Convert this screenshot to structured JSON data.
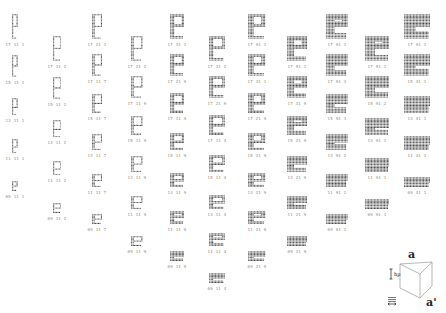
{
  "glyph_char": "e",
  "dot_color": "#3a3a3a",
  "label_color": "#888888",
  "columns": [
    {
      "x": 15,
      "y0": 14,
      "step": 38,
      "w": 6,
      "weights": 1,
      "labels": [
        "17 11 1",
        "15 11 1",
        "13 11 1",
        "11 11 1",
        "09 11 1"
      ]
    },
    {
      "x": 57,
      "y0": 36,
      "step": 38,
      "w": 8,
      "weights": 1,
      "labels": [
        "17 11 2",
        "15 11 2",
        "13 11 2",
        "11 11 2",
        "09 11 2"
      ]
    },
    {
      "x": 97,
      "y0": 14,
      "step": 37,
      "w": 10,
      "weights": 2,
      "labels": [
        "17 21 1",
        "17 11 7",
        "15 11 7",
        "13 11 7",
        "11 11 7",
        "09 11 7"
      ]
    },
    {
      "x": 137,
      "y0": 36,
      "step": 37,
      "w": 12,
      "weights": 2,
      "labels": [
        "17 21 2",
        "17 11 9",
        "15 11 9",
        "13 11 9",
        "11 11 9",
        "09 11 9"
      ]
    },
    {
      "x": 177,
      "y0": 14,
      "step": 37,
      "w": 14,
      "weights": 3,
      "labels": [
        "17 31 1",
        "17 21 9",
        "17 11 9",
        "15 11 9",
        "13 11 9",
        "11 11 9",
        "09 11 9"
      ]
    },
    {
      "x": 217,
      "y0": 36,
      "step": 37,
      "w": 16,
      "weights": 3,
      "labels": [
        "17 31 2",
        "17 21 9",
        "17 11 4",
        "15 11 4",
        "13 11 4",
        "11 11 4",
        "09 11 4"
      ]
    },
    {
      "x": 257,
      "y0": 14,
      "step": 37,
      "w": 18,
      "weights": 4,
      "labels": [
        "17 91 1",
        "17 31 1",
        "17 21 9",
        "15 21 9",
        "13 21 9",
        "11 21 9",
        "09 21 9"
      ]
    },
    {
      "x": 297,
      "y0": 36,
      "step": 37,
      "w": 20,
      "weights": 5,
      "labels": [
        "17 91 1",
        "17 31 9",
        "15 21 9",
        "13 21 9",
        "11 21 9",
        "09 21 9"
      ]
    },
    {
      "x": 337,
      "y0": 14,
      "step": 37,
      "w": 22,
      "weights": 6,
      "labels": [
        "17 91 1",
        "17 91 3",
        "15 91 3",
        "13 91 2",
        "11 91 2",
        "09 91 1"
      ]
    },
    {
      "x": 377,
      "y0": 36,
      "step": 37,
      "w": 24,
      "weights": 7,
      "labels": [
        "17 91 1",
        "15 91 2",
        "13 91 1",
        "11 91 1",
        "09 91 1"
      ]
    },
    {
      "x": 417,
      "y0": 14,
      "step": 37,
      "w": 26,
      "weights": 8,
      "labels": [
        "17 91 1",
        "15 41 1",
        "13 41 1",
        "11 41 1",
        "09 41 1"
      ]
    }
  ],
  "legend": {
    "top_label": "a",
    "bottom_label": "a'",
    "height_symbol": "hp",
    "width_symbol": "≡"
  }
}
